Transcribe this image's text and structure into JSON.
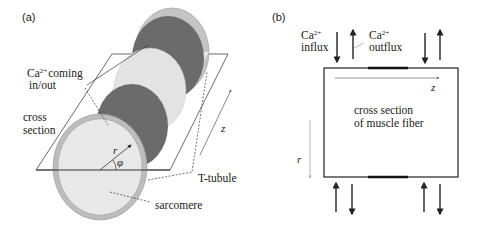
{
  "figure": {
    "panel_a": {
      "label": "(a)",
      "annotations": {
        "ca_line1_prefix": "Ca",
        "ca_line1_sup": "2+",
        "ca_line1_suffix": "coming",
        "ca_line2": "in/out",
        "cross_line1": "cross",
        "cross_line2": "section",
        "r": "r",
        "phi": "φ",
        "z": "z",
        "t_tubule": "T-tubule",
        "sarcomere": "sarcomere"
      },
      "colors": {
        "dark_band": "#6b6b6b",
        "light_band": "#e6e6e6",
        "outer_ring": "#bdbdbd",
        "line": "#333333"
      }
    },
    "panel_b": {
      "label": "(b)",
      "annotations": {
        "influx_sym": "Ca",
        "influx_sup": "2+",
        "influx_label": "influx",
        "outflux_sym": "Ca",
        "outflux_sup": "2+",
        "outflux_label": "outflux",
        "z": "z",
        "r": "r",
        "center_line1": "cross section",
        "center_line2": "of muscle fiber"
      }
    }
  }
}
